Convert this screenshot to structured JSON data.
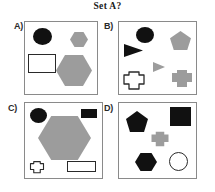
{
  "title": "Set A?",
  "colors": {
    "background": "#ffffff",
    "panel_border": "#8a8a8a",
    "black_fill": "#111111",
    "gray_fill": "#9c9c9c",
    "white_fill": "#ffffff",
    "outline_stroke": "#2a2a2a",
    "text": "#1a1a1a"
  },
  "panels": [
    {
      "label": "A)",
      "shapes": [
        {
          "name": "black-circle",
          "kind": "circle",
          "fill": "black"
        },
        {
          "name": "gray-hexagon-small",
          "kind": "hexagon",
          "fill": "gray"
        },
        {
          "name": "white-rectangle",
          "kind": "rectangle",
          "fill": "white"
        },
        {
          "name": "gray-hexagon-large",
          "kind": "hexagon",
          "fill": "gray"
        }
      ]
    },
    {
      "label": "B)",
      "shapes": [
        {
          "name": "black-circle",
          "kind": "circle",
          "fill": "black"
        },
        {
          "name": "black-triangle",
          "kind": "triangle-right",
          "fill": "black"
        },
        {
          "name": "gray-pentagon",
          "kind": "pentagon",
          "fill": "gray"
        },
        {
          "name": "gray-triangle-small",
          "kind": "triangle-right",
          "fill": "gray"
        },
        {
          "name": "white-star-octagon",
          "kind": "star-octagon",
          "fill": "white"
        },
        {
          "name": "gray-heptagon",
          "kind": "star-octagon",
          "fill": "gray"
        }
      ]
    },
    {
      "label": "C)",
      "shapes": [
        {
          "name": "black-circle",
          "kind": "circle",
          "fill": "black"
        },
        {
          "name": "black-rectangle",
          "kind": "rectangle",
          "fill": "black"
        },
        {
          "name": "gray-hexagon-large",
          "kind": "hexagon",
          "fill": "gray"
        },
        {
          "name": "white-star-octagon-small",
          "kind": "star-octagon",
          "fill": "white"
        },
        {
          "name": "white-rectangle",
          "kind": "rectangle",
          "fill": "white"
        }
      ]
    },
    {
      "label": "D)",
      "shapes": [
        {
          "name": "black-pentagon",
          "kind": "pentagon",
          "fill": "black"
        },
        {
          "name": "black-square",
          "kind": "rectangle",
          "fill": "black"
        },
        {
          "name": "gray-star-octagon",
          "kind": "star-octagon",
          "fill": "gray"
        },
        {
          "name": "black-hexagon",
          "kind": "hexagon",
          "fill": "black"
        },
        {
          "name": "white-circle",
          "kind": "circle",
          "fill": "white"
        }
      ]
    }
  ]
}
